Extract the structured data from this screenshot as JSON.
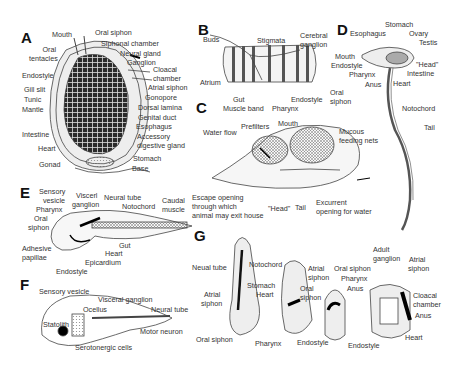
{
  "figure": {
    "panels": {
      "A": {
        "letter": "A",
        "labels": {
          "mouth": "Mouth",
          "oral_siphon": "Oral siphon",
          "oral_tentacles_1": "Oral",
          "oral_tentacles_2": "tentacles",
          "siphonal_chamber": "Siphonal chamber",
          "neural_gland": "Neural gland",
          "ganglion": "Ganglion",
          "cloacal_chamber_1": "Cloacal",
          "cloacal_chamber_2": "chamber",
          "atrial_siphon": "Atrial siphon",
          "endostyle": "Endostyle",
          "gill_slit": "Gill slit",
          "tunic": "Tunic",
          "mantle": "Mantle",
          "gonopore": "Gonopore",
          "dorsal_lamina": "Dorsal lamina",
          "genital_duct": "Genital duct",
          "esophagus": "Esophagus",
          "accessory_1": "Accessory",
          "accessory_2": "digestive gland",
          "intestine": "Intestine",
          "heart": "Heart",
          "stomach": "Stomach",
          "gonad": "Gonad",
          "base": "Base"
        }
      },
      "B": {
        "letter": "B",
        "labels": {
          "buds": "Buds",
          "stigmata": "Stigmata",
          "cerebral_ganglion_1": "Cerebral",
          "cerebral_ganglion_2": "ganglion",
          "atrium": "Atrium",
          "gut": "Gut",
          "muscle_band": "Muscle band",
          "pharynx": "Pharynx",
          "endostyle": "Endostyle",
          "oral_siphon_1": "Oral",
          "oral_siphon_2": "siphon"
        }
      },
      "C": {
        "letter": "C",
        "labels": {
          "water_flow": "Water flow",
          "prefilters": "Prefilters",
          "mouth": "Mouth",
          "mucous_1": "Mucous",
          "mucous_2": "feeding nets",
          "escape_1": "Escape opening",
          "escape_2": "through which",
          "escape_3": "animal may exit house",
          "head": "\"Head\"",
          "tail": "Tail",
          "excurrent_1": "Excurrent",
          "excurrent_2": "opening for water"
        }
      },
      "D": {
        "letter": "D",
        "labels": {
          "stomach": "Stomach",
          "esophagus": "Esophagus",
          "ovary": "Ovary",
          "testis": "Testis",
          "mouth": "Mouth",
          "endostyle": "Endostyle",
          "head": "\"Head\"",
          "pharynx": "Pharynx",
          "intestine": "Intestine",
          "anus": "Anus",
          "heart": "Heart",
          "notochord": "Notochord",
          "tail": "Tail"
        }
      },
      "E": {
        "letter": "E",
        "labels": {
          "sensory_1": "Sensory",
          "sensory_2": "vesicle",
          "visceral_1": "Viscerl",
          "visceral_2": "ganglion",
          "neural_tube": "Neural tube",
          "notochord": "Notochord",
          "caudal_1": "Caudal",
          "caudal_2": "muscle",
          "pharynx": "Pharynx",
          "oral_1": "Oral",
          "oral_2": "siphon",
          "adhesive_1": "Adhesive",
          "adhesive_2": "papillae",
          "gut": "Gut",
          "heart": "Heart",
          "epicardium": "Epicardium",
          "endostyle": "Endostyle"
        }
      },
      "F": {
        "letter": "F",
        "labels": {
          "sensory_vesicle": "Sensory vesicle",
          "visceral_ganglion": "Visceral ganglion",
          "ocellus": "Ocellus",
          "neural_tube": "Neural tube",
          "statolith": "Statolith",
          "motor_neuron": "Motor neuron",
          "serotonergic": "Serotonergic cells"
        }
      },
      "G": {
        "letter": "G",
        "labels": {
          "neual_tube": "Neual tube",
          "notochord": "Notochord",
          "atrial_1": "Atrial",
          "atrial_2": "siphon",
          "stomach": "Stomach",
          "heart": "Heart",
          "oral_siphon": "Oral siphon",
          "pharynx": "Pharynx",
          "atrial2_1": "Atrial",
          "atrial2_2": "siphon",
          "oral2_1": "Oral",
          "oral2_2": "siphon",
          "endostyle": "Endostyle",
          "oral_siphon_3": "Oral siphon",
          "pharynx_2": "Pharynx",
          "anus": "Anus",
          "endostyle_2": "Endostyle",
          "adult_1": "Adult",
          "adult_2": "ganglion",
          "atrial3_1": "Atrial",
          "atrial3_2": "siphon",
          "cloacal_1": "Cloacal",
          "cloacal_2": "chamber",
          "anus_2": "Anus",
          "heart_2": "Heart"
        }
      }
    }
  }
}
